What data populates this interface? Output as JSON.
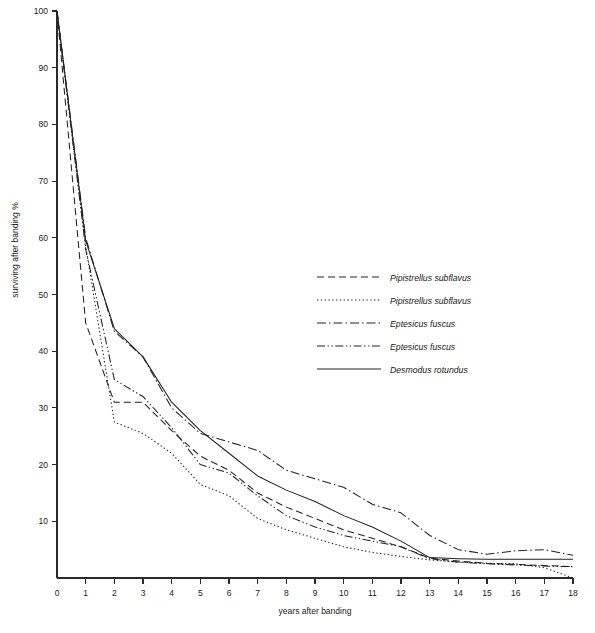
{
  "chart_data": {
    "type": "line",
    "title": "",
    "xlabel": "years after banding",
    "ylabel": "surviving after banding %",
    "xlim": [
      0,
      18
    ],
    "ylim": [
      0,
      100
    ],
    "xticks": [
      0,
      1,
      2,
      3,
      4,
      5,
      6,
      7,
      8,
      9,
      10,
      11,
      12,
      13,
      14,
      15,
      16,
      17,
      18
    ],
    "yticks": [
      10,
      20,
      30,
      40,
      50,
      60,
      70,
      80,
      90,
      100
    ],
    "grid": false,
    "legend_position": "center-right",
    "x": [
      0,
      1,
      2,
      3,
      4,
      5,
      6,
      7,
      8,
      9,
      10,
      11,
      12,
      13,
      14,
      15,
      16,
      17,
      18
    ],
    "series": [
      {
        "name": "Pipistrellus subflavus",
        "style": "dashed",
        "dash": "7,4",
        "values": [
          100,
          45,
          31,
          31,
          26,
          21.5,
          19,
          15,
          12.5,
          10.5,
          8.5,
          7,
          5.5,
          3.5,
          3,
          2.6,
          2.4,
          2.2,
          2
        ]
      },
      {
        "name": "Pipistrellus subflavus",
        "style": "dotted",
        "dash": "1.4,2.4",
        "values": [
          100,
          58.5,
          27.5,
          25.5,
          22,
          16.5,
          14.5,
          10.5,
          8.5,
          7,
          5.5,
          4.5,
          3.8,
          3.2,
          2.8,
          2.6,
          2.5,
          1.8,
          0
        ]
      },
      {
        "name": "Eptesicus fuscus",
        "style": "dash-dot",
        "dash": "9,3,1.5,3",
        "values": [
          100,
          60,
          43.5,
          39,
          30,
          25.5,
          24,
          22.5,
          19,
          17.5,
          16,
          13,
          11.5,
          7.5,
          5,
          4.2,
          4.8,
          5,
          4
        ]
      },
      {
        "name": "Eptesicus fuscus",
        "style": "dash-dot-dot",
        "dash": "8,2.5,1.4,2.5,1.4,2.5",
        "values": [
          100,
          58,
          35,
          32,
          26.5,
          20,
          18.5,
          14.5,
          11,
          9,
          7.5,
          6.5,
          5.5,
          3.4,
          2.8,
          2.5,
          2.3,
          2.1,
          2
        ]
      },
      {
        "name": "Desmodus rotundus",
        "style": "solid",
        "dash": "",
        "values": [
          100,
          59.5,
          44,
          39,
          31,
          26,
          22,
          18,
          15.5,
          13.5,
          11,
          9,
          6.5,
          3.6,
          3.4,
          3.3,
          3.3,
          3.3,
          3.3
        ]
      }
    ]
  },
  "legend": {
    "items": [
      {
        "label": "Pipistrellus subflavus"
      },
      {
        "label": "Pipistrellus subflavus"
      },
      {
        "label": "Eptesicus fuscus"
      },
      {
        "label": "Eptesicus fuscus"
      },
      {
        "label": "Desmodus rotundus"
      }
    ]
  }
}
